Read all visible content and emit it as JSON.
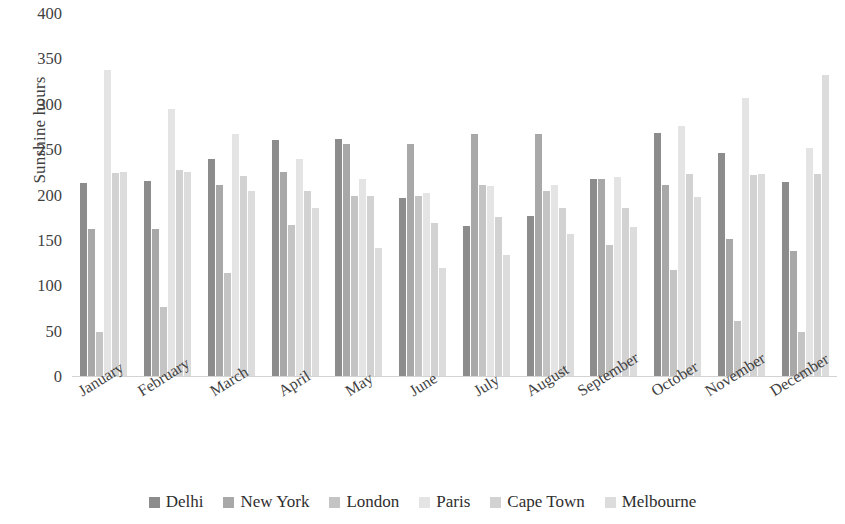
{
  "chart_data": {
    "type": "bar",
    "title": "",
    "xlabel": "",
    "ylabel": "Sunshine hours",
    "ylim": [
      0,
      400
    ],
    "ytick_values": [
      400,
      350,
      300,
      250,
      200,
      150,
      100,
      50,
      0
    ],
    "ytick_labels": [
      "400",
      "350",
      "300",
      "250",
      "200",
      "150",
      "100",
      "50",
      "0"
    ],
    "grid": false,
    "legend_position": "bottom",
    "categories": [
      "January",
      "February",
      "March",
      "April",
      "May",
      "June",
      "July",
      "August",
      "September",
      "October",
      "November",
      "December"
    ],
    "series": [
      {
        "name": "Delhi",
        "color": "#8c8c8c",
        "values": [
          214,
          216,
          240,
          261,
          262,
          197,
          166,
          177,
          218,
          269,
          247,
          215
        ]
      },
      {
        "name": "New York",
        "color": "#a8a8a8",
        "values": [
          163,
          163,
          212,
          226,
          257,
          257,
          268,
          268,
          218,
          212,
          152,
          139
        ]
      },
      {
        "name": "London",
        "color": "#c4c4c4",
        "values": [
          50,
          77,
          115,
          168,
          200,
          200,
          212,
          205,
          146,
          118,
          62,
          50
        ]
      },
      {
        "name": "Paris",
        "color": "#e4e4e4",
        "values": [
          338,
          295,
          268,
          240,
          218,
          203,
          210,
          212,
          220,
          277,
          307,
          252
        ]
      },
      {
        "name": "Cape Town",
        "color": "#d2d2d2",
        "values": [
          225,
          228,
          222,
          205,
          200,
          170,
          176,
          186,
          186,
          224,
          223,
          224
        ]
      },
      {
        "name": "Melbourne",
        "color": "#dcdcdc",
        "values": [
          226,
          226,
          205,
          186,
          142,
          120,
          135,
          158,
          165,
          198,
          224,
          333
        ]
      }
    ]
  }
}
